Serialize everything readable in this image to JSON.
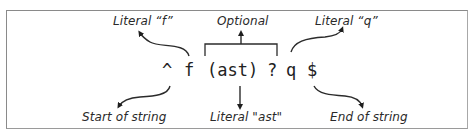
{
  "diagram": {
    "regex_tokens": [
      "^",
      "f",
      "(ast)",
      "?",
      "q",
      "$"
    ],
    "annotations": {
      "literal_f": "Literal “f”",
      "optional": "Optional",
      "literal_q": "Literal “q”",
      "start_of_string": "Start of string",
      "literal_ast": "Literal \"ast\"",
      "end_of_string": "End of string"
    }
  }
}
